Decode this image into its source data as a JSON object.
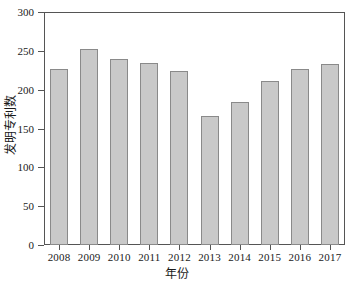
{
  "chart_data": {
    "type": "bar",
    "title": "",
    "xlabel": "年份",
    "ylabel": "发明专利数",
    "categories": [
      "2008",
      "2009",
      "2010",
      "2011",
      "2012",
      "2013",
      "2014",
      "2015",
      "2016",
      "2017"
    ],
    "values": [
      226,
      252,
      239,
      234,
      224,
      166,
      184,
      211,
      226,
      233
    ],
    "ylim": [
      0,
      300
    ],
    "yticks": [
      0,
      50,
      100,
      150,
      200,
      250,
      300
    ],
    "ytick_labels": [
      "0",
      "50",
      "100",
      "150",
      "200",
      "250",
      "300"
    ],
    "grid": false,
    "legend": false,
    "series": [
      {
        "name": "发明专利数",
        "values": [
          226,
          252,
          239,
          234,
          224,
          166,
          184,
          211,
          226,
          233
        ]
      }
    ],
    "colors": {
      "bar_fill": "#c9c9c9",
      "bar_edge": "#8a8a8a",
      "axis": "#555555",
      "background": "#ffffff",
      "text": "#1a1a1a"
    }
  }
}
